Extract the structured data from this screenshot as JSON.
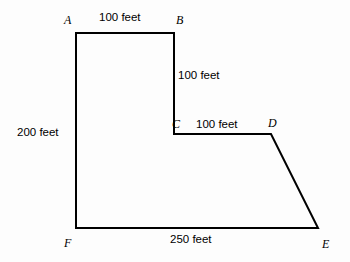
{
  "figure": {
    "background_color": "#fdfdfd",
    "stroke_color": "#000000",
    "stroke_width": 2
  },
  "vertices": [
    {
      "name": "A",
      "label": "A",
      "x": 76,
      "y": 33,
      "label_x": 64,
      "label_y": 14
    },
    {
      "name": "B",
      "label": "B",
      "x": 174,
      "y": 33,
      "label_x": 176,
      "label_y": 14
    },
    {
      "name": "C",
      "label": "C",
      "x": 174,
      "y": 134,
      "label_x": 172,
      "label_y": 118
    },
    {
      "name": "D",
      "label": "D",
      "x": 271,
      "y": 134,
      "label_x": 268,
      "label_y": 117
    },
    {
      "name": "E",
      "label": "E",
      "x": 318,
      "y": 228,
      "label_x": 322,
      "label_y": 238
    },
    {
      "name": "F",
      "label": "F",
      "x": 76,
      "y": 228,
      "label_x": 64,
      "label_y": 237
    }
  ],
  "edges": [
    {
      "name": "AB",
      "measure": "100 feet",
      "label_x": 99,
      "label_y": 12,
      "orientation": "horizontal"
    },
    {
      "name": "BC",
      "measure": "100 feet",
      "label_x": 178,
      "label_y": 70,
      "orientation": "vertical"
    },
    {
      "name": "CD",
      "measure": "100 feet",
      "label_x": 196,
      "label_y": 119,
      "orientation": "horizontal"
    },
    {
      "name": "DE",
      "measure": "",
      "label_x": 0,
      "label_y": 0,
      "orientation": "diagonal"
    },
    {
      "name": "EF",
      "measure": "250 feet",
      "label_x": 170,
      "label_y": 234,
      "orientation": "horizontal"
    },
    {
      "name": "FA",
      "measure": "200 feet",
      "label_x": 17,
      "label_y": 127,
      "orientation": "vertical"
    }
  ],
  "polygon_points": "76,33 174,33 174,134 271,134 318,228 76,228"
}
